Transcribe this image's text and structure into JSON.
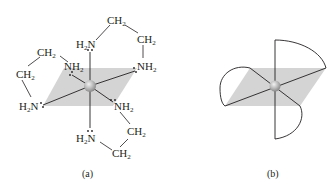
{
  "figure": {
    "panel_a": {
      "caption": "(a)",
      "description": "Octahedral metal complex with three ethylenediamine (en) ligands",
      "center_atom": "metal",
      "ligand_labels": {
        "top_n": "H",
        "top_n2": "N",
        "top_ch2_1": "CH",
        "top_ch2_2": "CH",
        "upper_right_nh2": "NH",
        "upper_left_nh2": "NH",
        "left_ch2_top": "CH",
        "left_ch2_bottom": "CH",
        "left_n": "H",
        "left_n2": "N",
        "lower_right_nh2": "NH",
        "bottom_n": "H",
        "bottom_n2": "N",
        "bottom_ch2_right": "CH",
        "bottom_ch2_bottom": "CH"
      },
      "subscript": "2"
    },
    "panel_b": {
      "caption": "(b)",
      "description": "Schematic of octahedral complex with three bidentate ligands drawn as arcs"
    },
    "colors": {
      "plane": "#d4d4d4",
      "line": "#231f20",
      "atom": "#b8b8b8"
    }
  }
}
